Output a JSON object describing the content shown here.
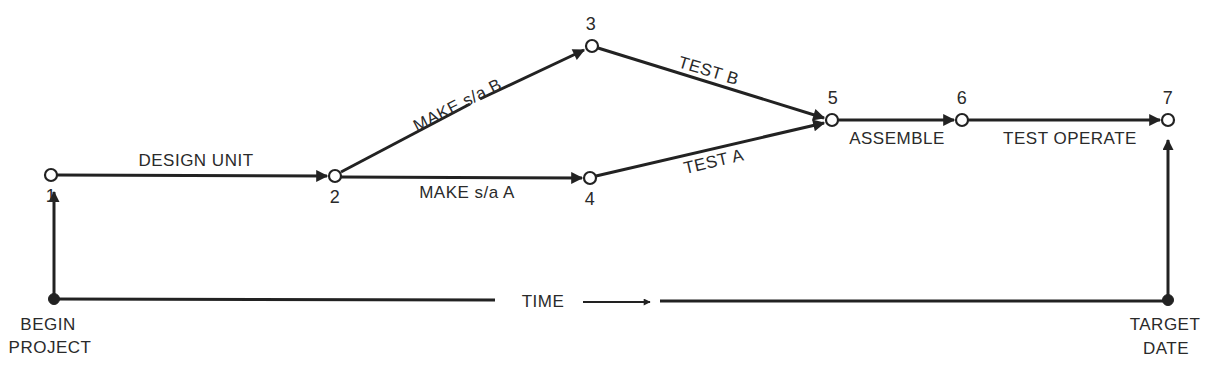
{
  "diagram": {
    "type": "network-activity-diagram",
    "nodes": [
      {
        "id": "1",
        "label": "1",
        "x": 51,
        "y": 175
      },
      {
        "id": "2",
        "label": "2",
        "x": 335,
        "y": 176
      },
      {
        "id": "3",
        "label": "3",
        "x": 592,
        "y": 46
      },
      {
        "id": "4",
        "label": "4",
        "x": 590,
        "y": 178
      },
      {
        "id": "5",
        "label": "5",
        "x": 832,
        "y": 120
      },
      {
        "id": "6",
        "label": "6",
        "x": 962,
        "y": 120
      },
      {
        "id": "7",
        "label": "7",
        "x": 1168,
        "y": 120
      }
    ],
    "activities": [
      {
        "from": "1",
        "to": "2",
        "label": "DESIGN UNIT"
      },
      {
        "from": "2",
        "to": "3",
        "label": "MAKE s/a B"
      },
      {
        "from": "2",
        "to": "4",
        "label": "MAKE s/a A"
      },
      {
        "from": "3",
        "to": "5",
        "label": "TEST B"
      },
      {
        "from": "4",
        "to": "5",
        "label": "TEST A"
      },
      {
        "from": "5",
        "to": "6",
        "label": "ASSEMBLE"
      },
      {
        "from": "6",
        "to": "7",
        "label": "TEST OPERATE"
      }
    ],
    "timeline": {
      "label": "TIME",
      "start": {
        "line1": "BEGIN",
        "line2": "PROJECT"
      },
      "end": {
        "line1": "TARGET",
        "line2": "DATE"
      }
    }
  }
}
